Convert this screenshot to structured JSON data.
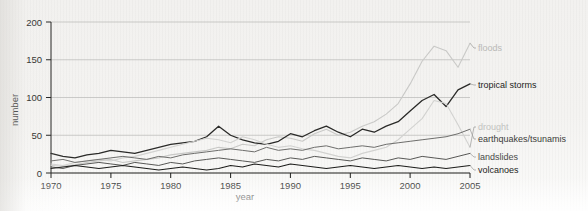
{
  "chart_data": {
    "type": "line",
    "title": "",
    "xlabel": "year",
    "ylabel": "number",
    "xlim": [
      1970,
      2005
    ],
    "ylim": [
      0,
      200
    ],
    "xticks": [
      1970,
      1975,
      1980,
      1985,
      1990,
      1995,
      2000,
      2005
    ],
    "yticks": [
      0,
      50,
      100,
      150,
      200
    ],
    "grid": true,
    "legend_position": "right-inline-labels",
    "x": [
      1970,
      1971,
      1972,
      1973,
      1974,
      1975,
      1976,
      1977,
      1978,
      1979,
      1980,
      1981,
      1982,
      1983,
      1984,
      1985,
      1986,
      1987,
      1988,
      1989,
      1990,
      1991,
      1992,
      1993,
      1994,
      1995,
      1996,
      1997,
      1998,
      1999,
      2000,
      2001,
      2002,
      2003,
      2004,
      2005
    ],
    "series": [
      {
        "name": "floods",
        "color": "#c9c9c7",
        "values": [
          10,
          9,
          11,
          14,
          16,
          18,
          14,
          16,
          18,
          20,
          24,
          26,
          28,
          30,
          34,
          32,
          38,
          36,
          44,
          48,
          46,
          42,
          52,
          58,
          50,
          54,
          62,
          68,
          78,
          92,
          118,
          148,
          168,
          162,
          140,
          172
        ]
      },
      {
        "name": "tropical storms",
        "color": "#2a2a28",
        "values": [
          26,
          22,
          20,
          24,
          26,
          30,
          28,
          26,
          30,
          34,
          38,
          40,
          42,
          48,
          62,
          50,
          44,
          40,
          38,
          42,
          52,
          48,
          56,
          62,
          54,
          48,
          58,
          54,
          62,
          68,
          82,
          96,
          104,
          88,
          110,
          118
        ]
      },
      {
        "name": "drought",
        "color": "#d2d2d0",
        "values": [
          12,
          10,
          14,
          16,
          18,
          16,
          20,
          22,
          26,
          30,
          34,
          38,
          42,
          46,
          44,
          40,
          48,
          44,
          38,
          34,
          36,
          32,
          30,
          26,
          22,
          20,
          26,
          30,
          34,
          44,
          58,
          72,
          96,
          92,
          64,
          34
        ]
      },
      {
        "name": "earthquakes/tsunamis",
        "color": "#6e6e6c",
        "values": [
          16,
          18,
          14,
          16,
          18,
          20,
          22,
          20,
          18,
          22,
          20,
          24,
          26,
          28,
          30,
          32,
          30,
          28,
          34,
          30,
          32,
          30,
          34,
          36,
          32,
          34,
          36,
          34,
          38,
          40,
          42,
          44,
          46,
          48,
          52,
          58
        ]
      },
      {
        "name": "landslides",
        "color": "#585856",
        "values": [
          8,
          6,
          10,
          12,
          14,
          12,
          10,
          14,
          12,
          10,
          14,
          12,
          16,
          18,
          20,
          18,
          16,
          14,
          18,
          16,
          20,
          18,
          22,
          20,
          18,
          16,
          20,
          18,
          16,
          20,
          18,
          22,
          20,
          18,
          22,
          26
        ]
      },
      {
        "name": "volcanoes",
        "color": "#1d1d1b",
        "values": [
          6,
          8,
          10,
          8,
          6,
          8,
          10,
          8,
          6,
          4,
          6,
          8,
          6,
          4,
          6,
          10,
          8,
          12,
          10,
          8,
          12,
          10,
          8,
          6,
          8,
          10,
          8,
          6,
          8,
          10,
          8,
          6,
          8,
          6,
          8,
          10
        ]
      }
    ],
    "legend_labels": [
      {
        "name": "floods",
        "label": "floods"
      },
      {
        "name": "tropical-storms",
        "label": "tropical storms"
      },
      {
        "name": "drought",
        "label": "drought"
      },
      {
        "name": "earthquakes-tsunamis",
        "label": "earthquakes/tsunamis"
      },
      {
        "name": "landslides",
        "label": "landslides"
      },
      {
        "name": "volcanoes",
        "label": "volcanoes"
      }
    ]
  }
}
